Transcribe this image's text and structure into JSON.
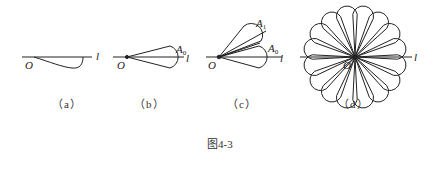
{
  "figure": {
    "caption": "图4-3",
    "stroke_color": "#222222",
    "panels": [
      {
        "id": "a",
        "label": "（a）",
        "origin_label": "O",
        "ray_label": "l",
        "points": []
      },
      {
        "id": "b",
        "label": "（b）",
        "origin_label": "O",
        "ray_label": "l",
        "points": [
          {
            "name": "A",
            "sub": "0"
          }
        ]
      },
      {
        "id": "c",
        "label": "（c）",
        "origin_label": "O",
        "ray_label": "l",
        "points": [
          {
            "name": "A",
            "sub": "1"
          },
          {
            "name": "A",
            "sub": "0"
          }
        ]
      },
      {
        "id": "d",
        "label": "（d）",
        "origin_label": "O",
        "ray_label": "l",
        "petal_count": 16,
        "points": []
      }
    ]
  }
}
